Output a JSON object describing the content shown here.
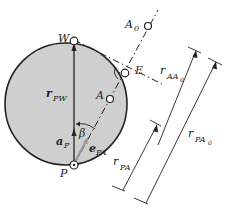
{
  "diagram": {
    "colors": {
      "disk_fill": "#cfcfcf",
      "stroke": "#222222",
      "background": "#ffffff",
      "unit_vector": "#9a9a9a"
    },
    "points": {
      "W": "W",
      "E": "E",
      "A": "A",
      "A0": "A",
      "A0_sub": "0",
      "P": "P"
    },
    "vectors": {
      "r_PW": "r",
      "r_PW_sub": "PW",
      "a_P": "a",
      "a_P_sub": "P",
      "e_PA": "e",
      "e_PA_sub": "PA"
    },
    "angle": {
      "beta": "β"
    },
    "dimensions": {
      "r_AA0": "r",
      "r_AA0_sub": "AA",
      "r_AA0_subsub": "0",
      "r_PA": "r",
      "r_PA_sub": "PA",
      "r_PA0": "r",
      "r_PA0_sub": "PA",
      "r_PA0_subsub": "0"
    }
  }
}
